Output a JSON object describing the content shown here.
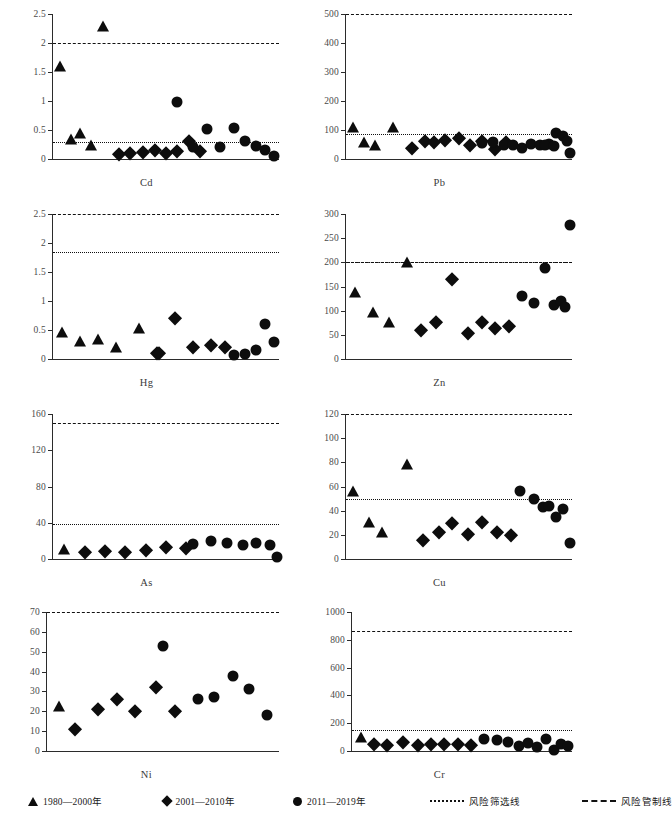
{
  "figure": {
    "width": 587,
    "height": 825,
    "marker_colors": {
      "fill": "#0d0d0d",
      "axis": "#2b2b2b",
      "tick_text": "#4a4a4a",
      "threshold": "#111111"
    }
  },
  "legend": {
    "items": [
      {
        "symbol": "triangle",
        "icon_name": "triangle-marker-icon",
        "label": "1980—2000年"
      },
      {
        "symbol": "diamond",
        "icon_name": "diamond-marker-icon",
        "label": "2001—2010年"
      },
      {
        "symbol": "circle",
        "icon_name": "circle-marker-icon",
        "label": "2011—2019年"
      },
      {
        "symbol": "dotted-line",
        "icon_name": "dotted-line-icon",
        "label": "风险筛选线"
      },
      {
        "symbol": "dashed-line",
        "icon_name": "dashed-line-icon",
        "label": "风险管制线"
      }
    ]
  },
  "chart_data": [
    {
      "type": "scatter",
      "title": "Cd",
      "xlabel": "Cd",
      "ylabel": "",
      "ylim": [
        0,
        2.5
      ],
      "yticks": [
        0,
        0.5,
        1,
        1.5,
        2,
        2.5
      ],
      "yticklabels": [
        "0",
        "0.5",
        "1",
        "1.5",
        "2",
        "2.5"
      ],
      "grid": false,
      "thresholds": [
        {
          "name": "风险筛选线",
          "style": "dotted",
          "value": 0.3
        },
        {
          "name": "风险管制线",
          "style": "dashed",
          "value": 2.0
        }
      ],
      "series": [
        {
          "name": "1980—2000年",
          "marker": "triangle",
          "x": [
            3,
            8,
            12,
            17,
            22
          ],
          "y": [
            1.5,
            0.25,
            0.35,
            0.15,
            2.2
          ]
        },
        {
          "name": "2001—2010年",
          "marker": "diamond",
          "x": [
            29,
            34,
            40,
            45,
            50,
            55,
            60,
            65
          ],
          "y": [
            0.08,
            0.11,
            0.12,
            0.16,
            0.1,
            0.13,
            0.31,
            0.13
          ]
        },
        {
          "name": "2011—2019年",
          "marker": "circle",
          "x": [
            55,
            62,
            68,
            74,
            80,
            85,
            90,
            94,
            98
          ],
          "y": [
            0.98,
            0.21,
            0.52,
            0.2,
            0.54,
            0.31,
            0.22,
            0.16,
            0.06
          ]
        }
      ]
    },
    {
      "type": "scatter",
      "title": "Pb",
      "xlabel": "Pb",
      "ylabel": "",
      "ylim": [
        0,
        500
      ],
      "yticks": [
        0,
        100,
        200,
        300,
        400,
        500
      ],
      "yticklabels": [
        "0",
        "100",
        "200",
        "300",
        "400",
        "500"
      ],
      "grid": false,
      "thresholds": [
        {
          "name": "风险筛选线",
          "style": "dotted",
          "value": 85
        },
        {
          "name": "风险管制线",
          "style": "dashed",
          "value": 500
        }
      ],
      "series": [
        {
          "name": "1980—2000年",
          "marker": "triangle",
          "x": [
            3,
            8,
            13,
            21
          ],
          "y": [
            92,
            38,
            30,
            93
          ]
        },
        {
          "name": "2001—2010年",
          "marker": "diamond",
          "x": [
            29,
            35,
            39,
            44,
            50,
            55,
            60,
            66,
            71
          ],
          "y": [
            38,
            63,
            57,
            66,
            72,
            47,
            63,
            34,
            60
          ]
        },
        {
          "name": "2011—2019年",
          "marker": "circle",
          "x": [
            60,
            65,
            70,
            74,
            78,
            82,
            86,
            90,
            93,
            96,
            98,
            88,
            92,
            99
          ],
          "y": [
            55,
            57,
            50,
            47,
            37,
            53,
            47,
            52,
            88,
            80,
            62,
            50,
            44,
            20
          ]
        }
      ]
    },
    {
      "type": "scatter",
      "title": "Hg",
      "xlabel": "Hg",
      "ylabel": "",
      "ylim": [
        0,
        2.5
      ],
      "yticks": [
        0,
        0.5,
        1,
        1.5,
        2,
        2.5
      ],
      "yticklabels": [
        "0",
        "0.5",
        "1",
        "1.5",
        "2",
        "2.5"
      ],
      "grid": false,
      "thresholds": [
        {
          "name": "风险筛选线",
          "style": "dotted",
          "value": 1.85
        },
        {
          "name": "风险管制线",
          "style": "dashed",
          "value": 2.5
        }
      ],
      "series": [
        {
          "name": "1980—2000年",
          "marker": "triangle",
          "x": [
            4,
            12,
            20,
            28,
            38
          ],
          "y": [
            0.37,
            0.22,
            0.25,
            0.11,
            0.44
          ]
        },
        {
          "name": "2001—2010年",
          "marker": "diamond",
          "x": [
            46,
            54,
            62,
            70,
            76,
            47
          ],
          "y": [
            0.1,
            0.7,
            0.2,
            0.25,
            0.21,
            0.1
          ]
        },
        {
          "name": "2011—2019年",
          "marker": "circle",
          "x": [
            80,
            85,
            90,
            94,
            98
          ],
          "y": [
            0.07,
            0.08,
            0.16,
            0.6,
            0.3
          ]
        }
      ]
    },
    {
      "type": "scatter",
      "title": "Zn",
      "xlabel": "Zn",
      "ylabel": "",
      "ylim": [
        0,
        300
      ],
      "yticks": [
        0,
        50,
        100,
        150,
        200,
        250,
        300
      ],
      "yticklabels": [
        "0",
        "50",
        "100",
        "150",
        "200",
        "250",
        "300"
      ],
      "grid": false,
      "thresholds": [
        {
          "name": "风险筛选线",
          "style": "dotted",
          "value": 201
        },
        {
          "name": "风险管制线",
          "style": "dashed",
          "value": 200
        }
      ],
      "series": [
        {
          "name": "1980—2000年",
          "marker": "triangle",
          "x": [
            4,
            12,
            19,
            27
          ],
          "y": [
            128,
            85,
            65,
            190
          ]
        },
        {
          "name": "2001—2010年",
          "marker": "diamond",
          "x": [
            33,
            40,
            47,
            54,
            60,
            66,
            72
          ],
          "y": [
            59,
            76,
            165,
            53,
            76,
            64,
            68
          ]
        },
        {
          "name": "2011—2019年",
          "marker": "circle",
          "x": [
            78,
            83,
            88,
            92,
            95,
            97,
            99
          ],
          "y": [
            130,
            115,
            188,
            111,
            120,
            107,
            277
          ]
        }
      ]
    },
    {
      "type": "scatter",
      "title": "As",
      "xlabel": "As",
      "ylabel": "",
      "ylim": [
        0,
        160
      ],
      "yticks": [
        0,
        40,
        80,
        120,
        160
      ],
      "yticklabels": [
        "0",
        "40",
        "80",
        "120",
        "160"
      ],
      "grid": false,
      "thresholds": [
        {
          "name": "风险筛选线",
          "style": "dotted",
          "value": 39
        },
        {
          "name": "风险管制线",
          "style": "dashed",
          "value": 150
        }
      ],
      "series": [
        {
          "name": "1980—2000年",
          "marker": "triangle",
          "x": [
            5
          ],
          "y": [
            5
          ]
        },
        {
          "name": "2001—2010年",
          "marker": "diamond",
          "x": [
            14,
            23,
            32,
            41,
            50,
            59
          ],
          "y": [
            8,
            9,
            8,
            10,
            13,
            12
          ]
        },
        {
          "name": "2011—2019年",
          "marker": "circle",
          "x": [
            62,
            70,
            77,
            84,
            90,
            96,
            99
          ],
          "y": [
            17,
            20,
            18,
            15,
            18,
            15,
            2
          ]
        }
      ]
    },
    {
      "type": "scatter",
      "title": "Cu",
      "xlabel": "Cu",
      "ylabel": "",
      "ylim": [
        0,
        120
      ],
      "yticks": [
        0,
        20,
        40,
        60,
        80,
        100,
        120
      ],
      "yticklabels": [
        "0",
        "20",
        "40",
        "60",
        "80",
        "100",
        "120"
      ],
      "grid": false,
      "thresholds": [
        {
          "name": "风险筛选线",
          "style": "dotted",
          "value": 50
        },
        {
          "name": "风险管制线",
          "style": "dashed",
          "value": 120
        }
      ],
      "series": [
        {
          "name": "1980—2000年",
          "marker": "triangle",
          "x": [
            3,
            10,
            16,
            27
          ],
          "y": [
            52,
            26,
            18,
            74
          ]
        },
        {
          "name": "2001—2010年",
          "marker": "diamond",
          "x": [
            34,
            41,
            47,
            54,
            60,
            67,
            73
          ],
          "y": [
            16,
            22,
            30,
            21,
            31,
            22,
            20
          ]
        },
        {
          "name": "2011—2019年",
          "marker": "circle",
          "x": [
            77,
            83,
            87,
            90,
            93,
            96,
            99
          ],
          "y": [
            56,
            50,
            43,
            44,
            35,
            41,
            13
          ]
        }
      ]
    },
    {
      "type": "scatter",
      "title": "Ni",
      "xlabel": "Ni",
      "ylabel": "",
      "ylim": [
        0,
        70
      ],
      "yticks": [
        0,
        10,
        20,
        30,
        40,
        50,
        60,
        70
      ],
      "yticklabels": [
        "0",
        "10",
        "20",
        "30",
        "40",
        "50",
        "60",
        "70"
      ],
      "grid": false,
      "thresholds": [
        {
          "name": "风险管制线",
          "style": "dashed",
          "value": 70
        }
      ],
      "series": [
        {
          "name": "1980—2000年",
          "marker": "triangle",
          "x": [
            5
          ],
          "y": [
            20
          ]
        },
        {
          "name": "2001—2010年",
          "marker": "diamond",
          "x": [
            12,
            22,
            30,
            38,
            47,
            55
          ],
          "y": [
            11,
            21,
            26,
            20,
            32,
            20
          ]
        },
        {
          "name": "2011—2019年",
          "marker": "circle",
          "x": [
            50,
            65,
            72,
            80,
            87,
            95
          ],
          "y": [
            53,
            26,
            27,
            38,
            31,
            18
          ]
        }
      ]
    },
    {
      "type": "scatter",
      "title": "Cr",
      "xlabel": "Cr",
      "ylabel": "",
      "ylim": [
        0,
        1000
      ],
      "yticks": [
        0,
        200,
        400,
        600,
        800,
        1000
      ],
      "yticklabels": [
        "0",
        "200",
        "400",
        "600",
        "800",
        "1000"
      ],
      "grid": false,
      "thresholds": [
        {
          "name": "风险筛选线",
          "style": "dotted",
          "value": 150
        },
        {
          "name": "风险管制线",
          "style": "dashed",
          "value": 860
        }
      ],
      "series": [
        {
          "name": "1980—2000年",
          "marker": "triangle",
          "x": [
            4
          ],
          "y": [
            60
          ]
        },
        {
          "name": "2001—2010年",
          "marker": "diamond",
          "x": [
            10,
            16,
            23,
            30,
            36,
            42,
            48,
            54
          ],
          "y": [
            48,
            42,
            68,
            42,
            50,
            48,
            52,
            45
          ]
        },
        {
          "name": "2011—2019年",
          "marker": "circle",
          "x": [
            60,
            66,
            71,
            76,
            80,
            84,
            88,
            92,
            95,
            98
          ],
          "y": [
            88,
            78,
            62,
            38,
            58,
            30,
            85,
            10,
            48,
            35
          ]
        }
      ]
    }
  ]
}
